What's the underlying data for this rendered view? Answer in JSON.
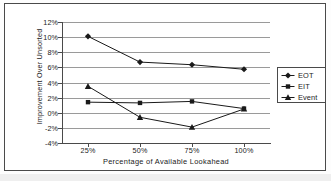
{
  "chart_data": {
    "type": "line",
    "title": "",
    "xlabel": "Percentage of Available Lookahead",
    "ylabel": "Improvement Over Unsorted",
    "categories": [
      "25%",
      "50%",
      "75%",
      "100%"
    ],
    "x": [
      25,
      50,
      75,
      100
    ],
    "ylim": [
      -4,
      12
    ],
    "ytick_step": 2,
    "ytick_labels": [
      "12%",
      "10%",
      "8%",
      "6%",
      "4%",
      "2%",
      "0%",
      "-2%",
      "-4%"
    ],
    "ytick_values": [
      12,
      10,
      8,
      6,
      4,
      2,
      0,
      -2,
      -4
    ],
    "grid": "horizontal",
    "legend_position": "right",
    "series": [
      {
        "name": "EOT",
        "marker": "diamond",
        "color": "#1a1a1a",
        "values": [
          10.1,
          6.7,
          6.35,
          5.75
        ]
      },
      {
        "name": "EIT",
        "marker": "square",
        "color": "#1a1a1a",
        "values": [
          1.4,
          1.3,
          1.5,
          0.55
        ]
      },
      {
        "name": "Event",
        "marker": "triangle",
        "color": "#1a1a1a",
        "values": [
          3.5,
          -0.6,
          -1.9,
          0.5
        ]
      }
    ]
  },
  "legend": {
    "items": [
      {
        "label": "EOT",
        "marker": "diamond"
      },
      {
        "label": "EIT",
        "marker": "square"
      },
      {
        "label": "Event",
        "marker": "triangle"
      }
    ]
  },
  "colors": {
    "line": "#1a1a1a",
    "grid": "#9a9a9a",
    "axis": "#4a4a4a",
    "frame": "#4a4a4a",
    "background": "#ffffff"
  }
}
